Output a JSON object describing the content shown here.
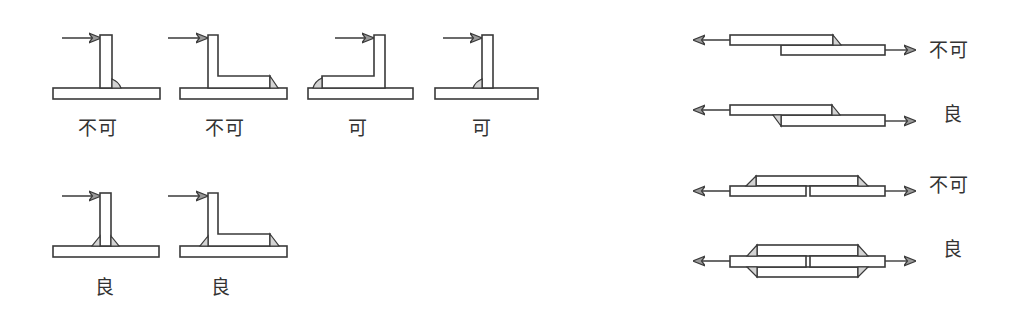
{
  "colors": {
    "line": "#3a3a3a",
    "weld_fill": "#d4d4d4",
    "arrow_fill": "#9a9a9a",
    "label_text": "#333333",
    "background": "#ffffff"
  },
  "fillet_joints": {
    "top_row": [
      {
        "id": "f1",
        "shape": "T-joint",
        "weld": "right side only",
        "label": "不可"
      },
      {
        "id": "f2",
        "shape": "L-joint (arm right)",
        "weld": "toe of arm only",
        "label": "不可"
      },
      {
        "id": "f3",
        "shape": "L-joint (arm left)",
        "weld": "toe of arm only",
        "label": "可"
      },
      {
        "id": "f4",
        "shape": "T-joint",
        "weld": "left side only",
        "label": "可"
      }
    ],
    "bottom_row": [
      {
        "id": "f5",
        "shape": "T-joint",
        "weld": "both sides",
        "label": "良"
      },
      {
        "id": "f6",
        "shape": "L-joint (arm right)",
        "weld": "heel and toe",
        "label": "良"
      }
    ]
  },
  "tension_joints": [
    {
      "id": "t1",
      "shape": "single lap joint",
      "weld": "one fillet",
      "label": "不可"
    },
    {
      "id": "t2",
      "shape": "single lap joint",
      "weld": "two fillets",
      "label": "良"
    },
    {
      "id": "t3",
      "shape": "single strap butt joint",
      "weld": "strap on one side",
      "label": "不可"
    },
    {
      "id": "t4",
      "shape": "double strap butt joint",
      "weld": "straps on both sides",
      "label": "良"
    }
  ]
}
